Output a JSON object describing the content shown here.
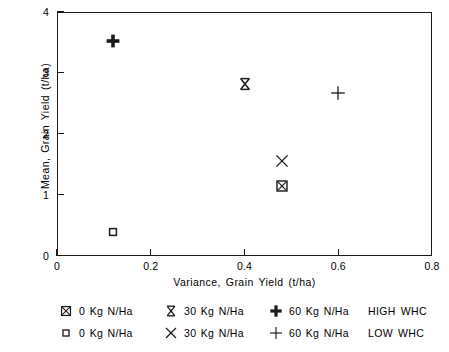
{
  "chart_data": {
    "type": "scatter",
    "title": "",
    "xlabel": "Variance, Grain Yield (t/ha)",
    "ylabel": "Mean, Grain Yield (t/ha)",
    "xlim": [
      0,
      0.8
    ],
    "ylim": [
      0,
      4
    ],
    "xticks": [
      "0",
      "0.2",
      "0.4",
      "0.6",
      "0.8"
    ],
    "xtick_values": [
      0,
      0.2,
      0.4,
      0.6,
      0.8
    ],
    "yticks": [
      "0",
      "1",
      "2",
      "3",
      "4"
    ],
    "ytick_values": [
      0,
      1,
      2,
      3,
      4
    ],
    "grid": false,
    "legend_position": "below",
    "series": [
      {
        "name": "0 Kg N/Ha HIGH WHC",
        "marker": "boxed-x",
        "points": [
          {
            "x": 0.48,
            "y": 1.15
          }
        ]
      },
      {
        "name": "30 Kg N/Ha HIGH WHC",
        "marker": "bowtie-x",
        "points": [
          {
            "x": 0.4,
            "y": 2.82
          }
        ]
      },
      {
        "name": "60 Kg N/Ha HIGH WHC",
        "marker": "bold-plus",
        "points": [
          {
            "x": 0.12,
            "y": 3.53
          }
        ]
      },
      {
        "name": "0 Kg N/Ha LOW WHC",
        "marker": "open-square",
        "points": [
          {
            "x": 0.12,
            "y": 0.4
          }
        ]
      },
      {
        "name": "30 Kg N/Ha LOW WHC",
        "marker": "x",
        "points": [
          {
            "x": 0.48,
            "y": 1.55
          }
        ]
      },
      {
        "name": "60 Kg N/Ha LOW WHC",
        "marker": "thin-plus",
        "points": [
          {
            "x": 0.6,
            "y": 2.67
          }
        ]
      }
    ]
  },
  "axes": {
    "x_title": "Variance, Grain Yield (t/ha)",
    "y_title": "Mean, Grain Yield (t/ha)",
    "x_tick_labels": [
      "0",
      "0.2",
      "0.4",
      "0.6",
      "0.8"
    ],
    "y_tick_labels": [
      "0",
      "1",
      "2",
      "3",
      "4"
    ]
  },
  "legend": {
    "rows": [
      {
        "group_label": "HIGH WHC",
        "entries": [
          {
            "symbol": "boxed-x",
            "label": "0 Kg N/Ha"
          },
          {
            "symbol": "bowtie-x",
            "label": "30 Kg N/Ha"
          },
          {
            "symbol": "bold-plus",
            "label": "60 Kg N/Ha"
          }
        ]
      },
      {
        "group_label": "LOW WHC",
        "entries": [
          {
            "symbol": "open-square",
            "label": "0 Kg N/Ha"
          },
          {
            "symbol": "x",
            "label": "30 Kg N/Ha"
          },
          {
            "symbol": "thin-plus",
            "label": "60 Kg N/Ha"
          }
        ]
      }
    ]
  },
  "colors": {
    "ink": "#1a1a1a",
    "background": "#ffffff"
  }
}
